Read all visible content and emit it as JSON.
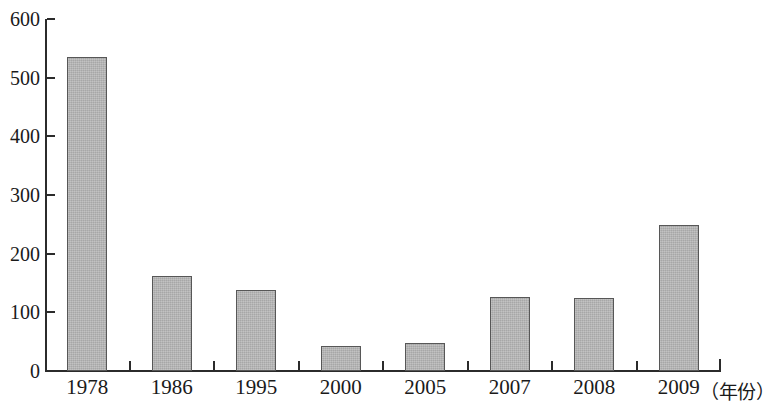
{
  "chart_data": {
    "type": "bar",
    "title": "",
    "subtitle": "",
    "xlabel": "（年份）",
    "ylabel": "",
    "categories": [
      "1978",
      "1986",
      "1995",
      "2000",
      "2005",
      "2007",
      "2008",
      "2009"
    ],
    "values": [
      535,
      162,
      138,
      42,
      48,
      126,
      124,
      249
    ],
    "ylim": [
      0,
      600
    ],
    "ytick_labels": [
      "0",
      "100",
      "200",
      "300",
      "400",
      "500",
      "600"
    ],
    "ytick_values": [
      0,
      100,
      200,
      300,
      400,
      500,
      600
    ],
    "grid": false,
    "legend": null,
    "series": [
      {
        "name": "",
        "values": [
          535,
          162,
          138,
          42,
          48,
          126,
          124,
          249
        ]
      }
    ],
    "bar_fill_color": "#b2b2b2",
    "bar_border_color": "#575757",
    "axis_color": "#2b2b2b",
    "background_color": "#ffffff"
  }
}
